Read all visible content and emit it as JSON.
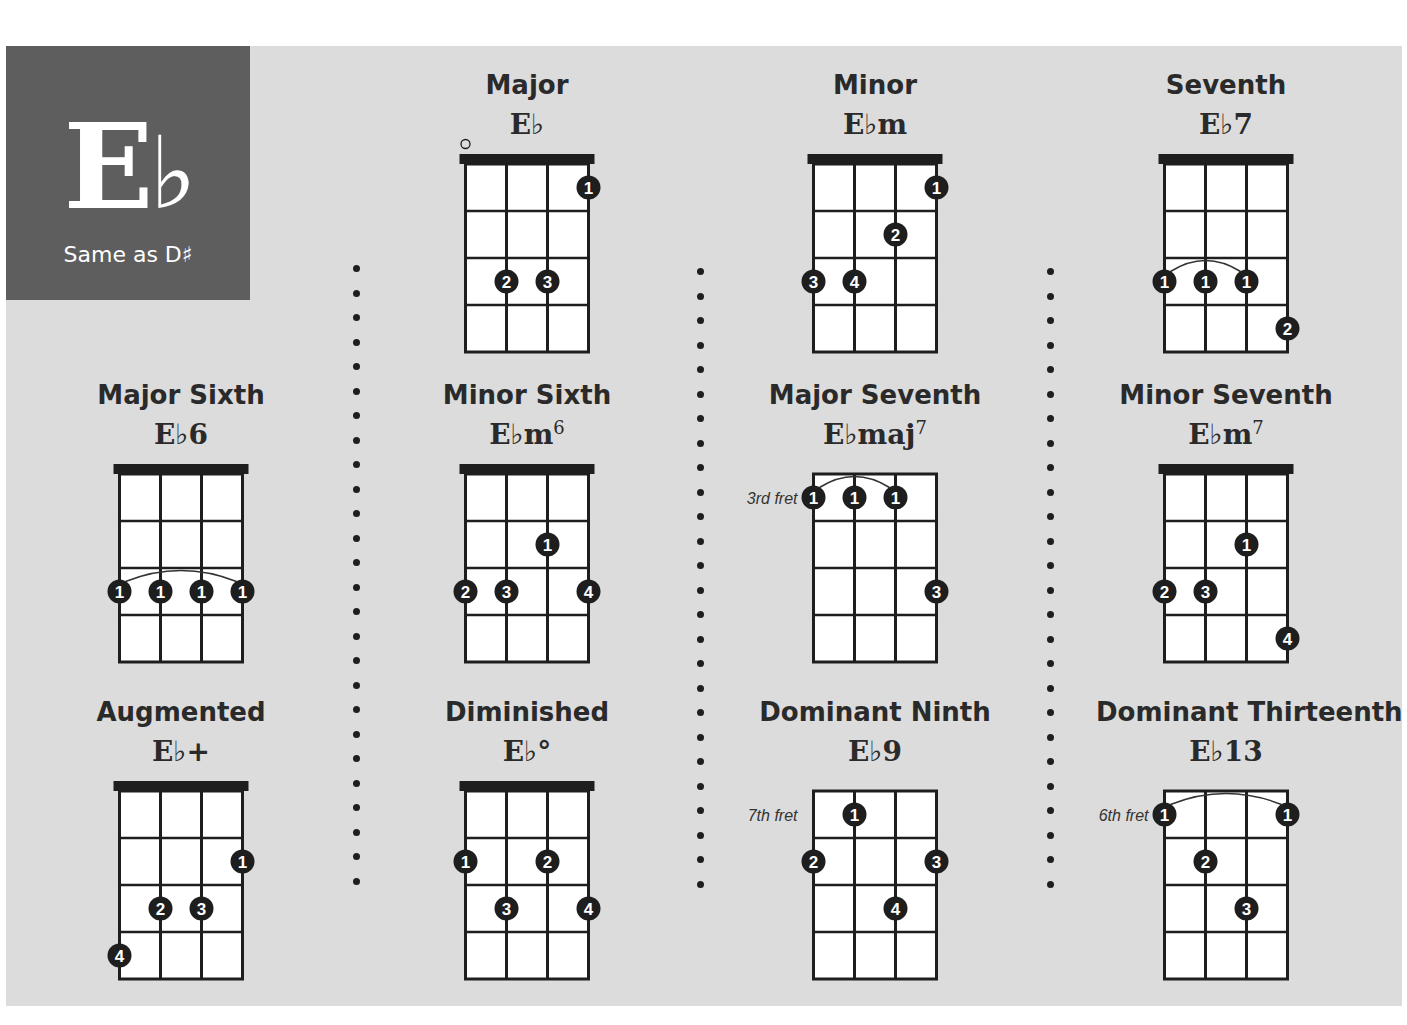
{
  "key": {
    "name": "E♭",
    "letter": "E",
    "accidental": "♭",
    "subtitle": "Same as D♯"
  },
  "colors": {
    "background": "#dcdcdc",
    "key_box": "#5e5e5e",
    "ink": "#1e1e1e",
    "fretboard": "#ffffff"
  },
  "diagram_spec": {
    "strings": 4,
    "frets_shown": 4
  },
  "chords": [
    {
      "name": "Major",
      "symbol": "E♭",
      "sup": "",
      "row": 0,
      "col": 1,
      "nut": true,
      "fret_label": "",
      "open_strings": [
        0
      ],
      "fingers": [
        {
          "string": 3,
          "fret": 1,
          "finger": "1"
        },
        {
          "string": 1,
          "fret": 3,
          "finger": "2"
        },
        {
          "string": 2,
          "fret": 3,
          "finger": "3"
        }
      ],
      "barre": null
    },
    {
      "name": "Minor",
      "symbol": "E♭m",
      "sup": "",
      "row": 0,
      "col": 2,
      "nut": true,
      "fret_label": "",
      "open_strings": [],
      "fingers": [
        {
          "string": 3,
          "fret": 1,
          "finger": "1"
        },
        {
          "string": 2,
          "fret": 2,
          "finger": "2"
        },
        {
          "string": 0,
          "fret": 3,
          "finger": "3"
        },
        {
          "string": 1,
          "fret": 3,
          "finger": "4"
        }
      ],
      "barre": null
    },
    {
      "name": "Seventh",
      "symbol": "E♭7",
      "sup": "",
      "row": 0,
      "col": 3,
      "nut": true,
      "fret_label": "",
      "open_strings": [],
      "fingers": [
        {
          "string": 0,
          "fret": 3,
          "finger": "1"
        },
        {
          "string": 1,
          "fret": 3,
          "finger": "1"
        },
        {
          "string": 2,
          "fret": 3,
          "finger": "1"
        },
        {
          "string": 3,
          "fret": 4,
          "finger": "2"
        }
      ],
      "barre": {
        "fret": 3,
        "from": 0,
        "to": 2
      }
    },
    {
      "name": "Major Sixth",
      "symbol": "E♭6",
      "sup": "",
      "row": 1,
      "col": 0,
      "nut": true,
      "fret_label": "",
      "open_strings": [],
      "fingers": [
        {
          "string": 0,
          "fret": 3,
          "finger": "1"
        },
        {
          "string": 1,
          "fret": 3,
          "finger": "1"
        },
        {
          "string": 2,
          "fret": 3,
          "finger": "1"
        },
        {
          "string": 3,
          "fret": 3,
          "finger": "1"
        }
      ],
      "barre": {
        "fret": 3,
        "from": 0,
        "to": 3
      }
    },
    {
      "name": "Minor Sixth",
      "symbol": "E♭m",
      "sup": "6",
      "row": 1,
      "col": 1,
      "nut": true,
      "fret_label": "",
      "open_strings": [],
      "fingers": [
        {
          "string": 2,
          "fret": 2,
          "finger": "1"
        },
        {
          "string": 0,
          "fret": 3,
          "finger": "2"
        },
        {
          "string": 1,
          "fret": 3,
          "finger": "3"
        },
        {
          "string": 3,
          "fret": 3,
          "finger": "4"
        }
      ],
      "barre": null
    },
    {
      "name": "Major Seventh",
      "symbol": "E♭maj",
      "sup": "7",
      "row": 1,
      "col": 2,
      "nut": false,
      "fret_label": "3rd fret",
      "open_strings": [],
      "fingers": [
        {
          "string": 0,
          "fret": 1,
          "finger": "1"
        },
        {
          "string": 1,
          "fret": 1,
          "finger": "1"
        },
        {
          "string": 2,
          "fret": 1,
          "finger": "1"
        },
        {
          "string": 3,
          "fret": 3,
          "finger": "3"
        }
      ],
      "barre": {
        "fret": 1,
        "from": 0,
        "to": 2
      }
    },
    {
      "name": "Minor Seventh",
      "symbol": "E♭m",
      "sup": "7",
      "row": 1,
      "col": 3,
      "nut": true,
      "fret_label": "",
      "open_strings": [],
      "fingers": [
        {
          "string": 2,
          "fret": 2,
          "finger": "1"
        },
        {
          "string": 0,
          "fret": 3,
          "finger": "2"
        },
        {
          "string": 1,
          "fret": 3,
          "finger": "3"
        },
        {
          "string": 3,
          "fret": 4,
          "finger": "4"
        }
      ],
      "barre": null
    },
    {
      "name": "Augmented",
      "symbol": "E♭+",
      "sup": "",
      "row": 2,
      "col": 0,
      "nut": true,
      "fret_label": "",
      "open_strings": [],
      "fingers": [
        {
          "string": 3,
          "fret": 2,
          "finger": "1"
        },
        {
          "string": 1,
          "fret": 3,
          "finger": "2"
        },
        {
          "string": 2,
          "fret": 3,
          "finger": "3"
        },
        {
          "string": 0,
          "fret": 4,
          "finger": "4"
        }
      ],
      "barre": null
    },
    {
      "name": "Diminished",
      "symbol": "E♭°",
      "sup": "",
      "row": 2,
      "col": 1,
      "nut": true,
      "fret_label": "",
      "open_strings": [],
      "fingers": [
        {
          "string": 0,
          "fret": 2,
          "finger": "1"
        },
        {
          "string": 2,
          "fret": 2,
          "finger": "2"
        },
        {
          "string": 1,
          "fret": 3,
          "finger": "3"
        },
        {
          "string": 3,
          "fret": 3,
          "finger": "4"
        }
      ],
      "barre": null
    },
    {
      "name": "Dominant Ninth",
      "symbol": "E♭9",
      "sup": "",
      "row": 2,
      "col": 2,
      "nut": false,
      "fret_label": "7th fret",
      "open_strings": [],
      "fingers": [
        {
          "string": 1,
          "fret": 1,
          "finger": "1"
        },
        {
          "string": 0,
          "fret": 2,
          "finger": "2"
        },
        {
          "string": 3,
          "fret": 2,
          "finger": "3"
        },
        {
          "string": 2,
          "fret": 3,
          "finger": "4"
        }
      ],
      "barre": null
    },
    {
      "name": "Dominant Thirteenth",
      "symbol": "E♭13",
      "sup": "",
      "row": 2,
      "col": 3,
      "nut": false,
      "fret_label": "6th fret",
      "open_strings": [],
      "fingers": [
        {
          "string": 0,
          "fret": 1,
          "finger": "1"
        },
        {
          "string": 3,
          "fret": 1,
          "finger": "1"
        },
        {
          "string": 1,
          "fret": 2,
          "finger": "2"
        },
        {
          "string": 2,
          "fret": 3,
          "finger": "3"
        }
      ],
      "barre": {
        "fret": 1,
        "from": 0,
        "to": 3
      }
    }
  ]
}
